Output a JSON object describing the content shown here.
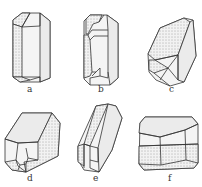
{
  "figure": {
    "header_fragment": "",
    "panels": [
      {
        "id": "a",
        "label": "a",
        "x": 27,
        "y": 85
      },
      {
        "id": "b",
        "label": "b",
        "x": 98,
        "y": 85
      },
      {
        "id": "c",
        "label": "c",
        "x": 169,
        "y": 85
      },
      {
        "id": "d",
        "label": "d",
        "x": 27,
        "y": 174
      },
      {
        "id": "e",
        "label": "e",
        "x": 93,
        "y": 174
      },
      {
        "id": "f",
        "label": "f",
        "x": 168,
        "y": 174
      }
    ],
    "stipple_color": "#555555",
    "line_color": "#333333"
  }
}
